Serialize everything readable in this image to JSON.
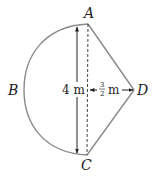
{
  "diagram": {
    "points": {
      "A": {
        "label": "A",
        "x": 88,
        "y": 24
      },
      "B": {
        "label": "B",
        "x": 24,
        "y": 90
      },
      "C": {
        "label": "C",
        "x": 87,
        "y": 155
      },
      "D": {
        "label": "D",
        "x": 134,
        "y": 90
      }
    },
    "measurements": {
      "vertical": {
        "value": "4",
        "unit": "m",
        "text": "4 m"
      },
      "horizontal": {
        "numerator": "3",
        "denominator": "2",
        "unit": "m"
      }
    },
    "colors": {
      "outline": "#8a8a8a",
      "arrow": "#222222",
      "dashed": "#444444",
      "text": "#222222"
    }
  }
}
